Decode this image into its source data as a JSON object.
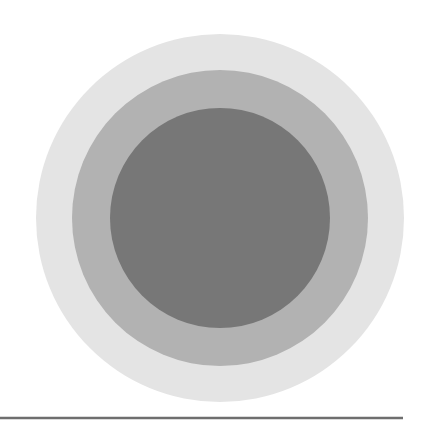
{
  "diagram": {
    "type": "concentric-circles",
    "background": "#ffffff",
    "center": {
      "x": 220,
      "y": 218
    },
    "circles": [
      {
        "name": "outer",
        "radius": 184,
        "color": "#e4e4e4"
      },
      {
        "name": "middle",
        "radius": 148,
        "color": "#b2b2b2"
      },
      {
        "name": "inner",
        "radius": 110,
        "color": "#777777"
      }
    ],
    "baseline": {
      "x1": 0,
      "x2": 403,
      "y": 418,
      "thickness": 2.5,
      "color": "#6e6e6e"
    }
  }
}
